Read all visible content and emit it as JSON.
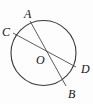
{
  "figure": {
    "type": "circle-geometry-diagram",
    "background_color": "#fdfdfd",
    "stroke_color": "#3a3a3a",
    "label_color": "#141414",
    "circle": {
      "center_label": "O",
      "cx": 43.5,
      "cy": 53,
      "r": 32.5
    },
    "points": [
      {
        "name": "A",
        "label": "A",
        "x": 30,
        "y": 21,
        "label_x": 24,
        "label_y": 8
      },
      {
        "name": "C",
        "label": "C",
        "x": 13,
        "y": 33,
        "label_x": 2,
        "label_y": 26
      },
      {
        "name": "O",
        "label": "O",
        "x": 43.5,
        "y": 53,
        "label_x": 36,
        "label_y": 54
      },
      {
        "name": "D",
        "label": "D",
        "x": 76,
        "y": 67,
        "label_x": 81,
        "label_y": 63
      },
      {
        "name": "B",
        "label": "B",
        "x": 66,
        "y": 86,
        "label_x": 68,
        "label_y": 88
      }
    ],
    "segments": [
      {
        "name": "chord-AB",
        "from": "A",
        "to": "B"
      },
      {
        "name": "chord-CD",
        "from": "C",
        "to": "D"
      }
    ]
  }
}
